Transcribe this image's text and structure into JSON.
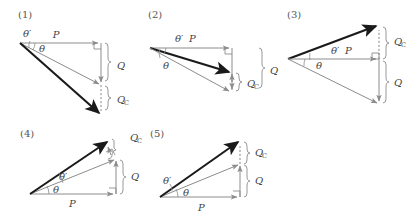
{
  "figure": {
    "background_color": "#ffffff",
    "thin_vector_color": "#8c8c8c",
    "thick_vector_color": "#1a1a1a",
    "label_color": "#444444",
    "panel_label_color": "#555555",
    "width": 417,
    "height": 219
  },
  "labels": {
    "P": "P",
    "Q": "Q",
    "Qc_main": "Q",
    "Qc_sub": "C",
    "theta": "θ",
    "theta_prime": "θ′"
  },
  "panels": [
    {
      "id": "panel-1",
      "name": "(1)",
      "label": "(1)",
      "origin_x": 20,
      "origin_y": 43,
      "labels": {
        "P": "P",
        "Q": "Q",
        "Qc": "Q",
        "Qc_sub": "C",
        "theta": "θ",
        "theta_prime": "θ′"
      },
      "vectors": [
        {
          "name": "P",
          "kind": "thin",
          "from": [
            20,
            43
          ],
          "to": [
            101,
            43
          ]
        },
        {
          "name": "resultant-theta",
          "kind": "thin",
          "from": [
            20,
            43
          ],
          "to": [
            101,
            85
          ]
        },
        {
          "name": "resultant-theta-prime",
          "kind": "thick",
          "from": [
            20,
            43
          ],
          "to": [
            101,
            114
          ]
        },
        {
          "name": "Q",
          "kind": "thin",
          "from": [
            101,
            43
          ],
          "to": [
            101,
            85
          ]
        },
        {
          "name": "Qc",
          "kind": "dashed",
          "from": [
            101,
            85
          ],
          "to": [
            101,
            114
          ]
        }
      ],
      "braces": [
        {
          "name": "Q-brace",
          "x": 108,
          "y1": 43,
          "y2": 85,
          "label": "Q"
        },
        {
          "name": "Qc-brace",
          "x": 108,
          "y1": 85,
          "y2": 114,
          "label": "Qc"
        }
      ]
    },
    {
      "id": "panel-2",
      "name": "(2)",
      "label": "(2)",
      "origin_x": 150,
      "origin_y": 48,
      "labels": {
        "P": "P",
        "Q": "Q",
        "Qc": "Q",
        "Qc_sub": "C",
        "theta": "θ",
        "theta_prime": "θ′"
      },
      "vectors": [
        {
          "name": "P",
          "kind": "thin",
          "from": [
            150,
            48
          ],
          "to": [
            232,
            48
          ]
        },
        {
          "name": "resultant-theta-prime",
          "kind": "thick",
          "from": [
            150,
            48
          ],
          "to": [
            232,
            73
          ]
        },
        {
          "name": "resultant-theta",
          "kind": "thin",
          "from": [
            150,
            48
          ],
          "to": [
            232,
            92
          ]
        },
        {
          "name": "Q",
          "kind": "thin",
          "from": [
            232,
            48
          ],
          "to": [
            232,
            92
          ]
        },
        {
          "name": "Qc",
          "kind": "dashed",
          "from": [
            232,
            73
          ],
          "to": [
            232,
            92
          ]
        }
      ],
      "braces": [
        {
          "name": "Qc-brace",
          "x": 239,
          "y1": 73,
          "y2": 92,
          "label": "Qc"
        },
        {
          "name": "Q-brace",
          "x": 262,
          "y1": 48,
          "y2": 92,
          "label": "Q"
        }
      ]
    },
    {
      "id": "panel-3",
      "name": "(3)",
      "label": "(3)",
      "origin_x": 288,
      "origin_y": 59,
      "labels": {
        "P": "P",
        "Q": "Q",
        "Qc": "Q",
        "Qc_sub": "C",
        "theta": "θ",
        "theta_prime": "θ′"
      },
      "vectors": [
        {
          "name": "resultant-theta-prime",
          "kind": "thick",
          "from": [
            288,
            59
          ],
          "to": [
            379,
            25
          ]
        },
        {
          "name": "P",
          "kind": "thin",
          "from": [
            288,
            59
          ],
          "to": [
            379,
            59
          ]
        },
        {
          "name": "resultant-theta",
          "kind": "thin",
          "from": [
            288,
            59
          ],
          "to": [
            379,
            104
          ]
        },
        {
          "name": "Qc",
          "kind": "dashed",
          "from": [
            379,
            59
          ],
          "to": [
            379,
            25
          ]
        },
        {
          "name": "Q",
          "kind": "thin",
          "from": [
            379,
            59
          ],
          "to": [
            379,
            104
          ]
        }
      ],
      "braces": [
        {
          "name": "Qc-brace",
          "x": 386,
          "y1": 25,
          "y2": 59,
          "label": "Qc"
        },
        {
          "name": "Q-brace",
          "x": 386,
          "y1": 59,
          "y2": 104,
          "label": "Q"
        }
      ]
    },
    {
      "id": "panel-4",
      "name": "(4)",
      "label": "(4)",
      "origin_x": 30,
      "origin_y": 194,
      "labels": {
        "P": "P",
        "Q": "Q",
        "Qc": "Q",
        "Qc_sub": "C",
        "theta": "θ",
        "theta_prime": "θ′"
      },
      "vectors": [
        {
          "name": "P",
          "kind": "thin",
          "from": [
            30,
            194
          ],
          "to": [
            116,
            194
          ]
        },
        {
          "name": "resultant-theta",
          "kind": "thin",
          "from": [
            30,
            194
          ],
          "to": [
            116,
            159
          ]
        },
        {
          "name": "resultant-theta-prime",
          "kind": "thick",
          "from": [
            30,
            194
          ],
          "to": [
            109,
            140
          ]
        },
        {
          "name": "Q",
          "kind": "thin",
          "from": [
            116,
            194
          ],
          "to": [
            116,
            159
          ]
        },
        {
          "name": "Qc",
          "kind": "thin",
          "from": [
            109,
            156
          ],
          "to": [
            109,
            140
          ]
        }
      ],
      "braces": [
        {
          "name": "Qc-brace",
          "x": 116,
          "y1": 138,
          "y2": 155,
          "label": "Qc"
        },
        {
          "name": "Q-brace",
          "x": 123,
          "y1": 159,
          "y2": 194,
          "label": "Q"
        }
      ]
    },
    {
      "id": "panel-5",
      "name": "(5)",
      "label": "(5)",
      "origin_x": 160,
      "origin_y": 197,
      "labels": {
        "P": "P",
        "Q": "Q",
        "Qc": "Q",
        "Qc_sub": "C",
        "theta": "θ",
        "theta_prime": "θ′"
      },
      "vectors": [
        {
          "name": "P",
          "kind": "thin",
          "from": [
            160,
            197
          ],
          "to": [
            240,
            197
          ]
        },
        {
          "name": "resultant-theta",
          "kind": "thin",
          "from": [
            160,
            197
          ],
          "to": [
            240,
            164
          ]
        },
        {
          "name": "resultant-theta-prime",
          "kind": "thick",
          "from": [
            160,
            197
          ],
          "to": [
            240,
            141
          ]
        },
        {
          "name": "Q",
          "kind": "thin",
          "from": [
            240,
            197
          ],
          "to": [
            240,
            164
          ]
        },
        {
          "name": "Qc",
          "kind": "dashed",
          "from": [
            240,
            164
          ],
          "to": [
            240,
            141
          ]
        }
      ],
      "braces": [
        {
          "name": "Qc-brace",
          "x": 247,
          "y1": 141,
          "y2": 164,
          "label": "Qc"
        },
        {
          "name": "Q-brace",
          "x": 247,
          "y1": 164,
          "y2": 197,
          "label": "Q"
        }
      ]
    }
  ]
}
